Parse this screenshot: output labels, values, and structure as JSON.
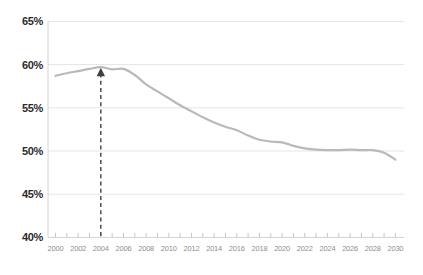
{
  "chart_data": {
    "type": "line",
    "title": "",
    "xlabel": "",
    "ylabel": "",
    "xlim": [
      2000,
      2030
    ],
    "ylim": [
      40,
      65
    ],
    "grid": "horizontal",
    "legend": "none",
    "x": [
      2000,
      2001,
      2002,
      2003,
      2004,
      2005,
      2006,
      2007,
      2008,
      2009,
      2010,
      2011,
      2012,
      2013,
      2014,
      2015,
      2016,
      2017,
      2018,
      2019,
      2020,
      2021,
      2022,
      2023,
      2024,
      2025,
      2026,
      2027,
      2028,
      2029,
      2030
    ],
    "series": [
      {
        "name": "rate-percent",
        "values": [
          58.7,
          59.0,
          59.25,
          59.5,
          59.7,
          59.45,
          59.5,
          58.8,
          57.7,
          56.9,
          56.1,
          55.3,
          54.6,
          53.9,
          53.3,
          52.8,
          52.4,
          51.8,
          51.3,
          51.1,
          51.0,
          50.6,
          50.3,
          50.15,
          50.1,
          50.1,
          50.15,
          50.1,
          50.1,
          49.8,
          49.0
        ]
      }
    ],
    "y_ticks": [
      65,
      60,
      55,
      50,
      45,
      40
    ],
    "y_tick_labels": [
      "65%",
      "60%",
      "55%",
      "50%",
      "45%",
      "40%"
    ],
    "x_label_years": [
      2000,
      2002,
      2004,
      2006,
      2008,
      2010,
      2012,
      2014,
      2016,
      2018,
      2020,
      2022,
      2024,
      2026,
      2028,
      2030
    ],
    "x_tick_labels": [
      "2000",
      "2002",
      "2004",
      "2006",
      "2008",
      "2010",
      "2012",
      "2014",
      "2016",
      "2018",
      "2020",
      "2022",
      "2024",
      "2026",
      "2028",
      "2030"
    ],
    "annotation": {
      "type": "dashed-vertical-arrow-up",
      "x_year": 2004,
      "points_to_value": 59.7,
      "from_axis_value": 40
    }
  },
  "colors": {
    "background": "#ffffff",
    "curve": "#b9b9b9",
    "gridline": "#e5e5e5",
    "axis_line": "#d4d4d4",
    "tick_mark": "#c6c6c6",
    "y_label": "#2b2b2b",
    "x_label": "#8e8e8e",
    "arrow": "#404040"
  }
}
